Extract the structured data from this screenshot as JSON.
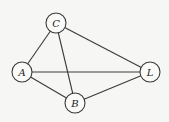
{
  "diagram": {
    "type": "undirected-graph",
    "nodes": [
      {
        "id": "C",
        "label": "C",
        "x": 56,
        "y": 23
      },
      {
        "id": "A",
        "label": "A",
        "x": 22,
        "y": 72
      },
      {
        "id": "B",
        "label": "B",
        "x": 75,
        "y": 103
      },
      {
        "id": "L",
        "label": "L",
        "x": 150,
        "y": 72
      }
    ],
    "edges": [
      {
        "from": "C",
        "to": "A"
      },
      {
        "from": "C",
        "to": "B"
      },
      {
        "from": "C",
        "to": "L"
      },
      {
        "from": "A",
        "to": "L"
      },
      {
        "from": "A",
        "to": "B"
      },
      {
        "from": "B",
        "to": "L"
      }
    ],
    "node_radius": 10,
    "colors": {
      "background": "#f6f6f4",
      "stroke": "#3a3a3a",
      "node_fill": "#fafaf8",
      "label": "#222222"
    }
  }
}
